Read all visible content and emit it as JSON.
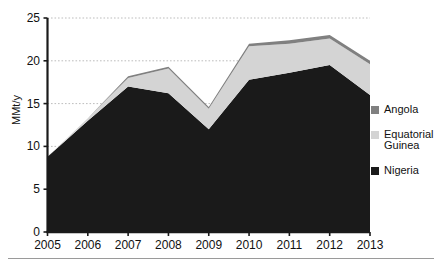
{
  "chart_data": {
    "type": "area",
    "stacked": true,
    "title": "",
    "subtitle": "",
    "xlabel": "",
    "ylabel": "MMt/y",
    "categories": [
      "2005",
      "2006",
      "2007",
      "2008",
      "2009",
      "2010",
      "2011",
      "2012",
      "2013"
    ],
    "x": [
      2005,
      2006,
      2007,
      2008,
      2009,
      2010,
      2011,
      2012,
      2013
    ],
    "series": [
      {
        "name": "Nigeria",
        "color": "#1a1a1a",
        "values": [
          8.8,
          13.0,
          17.0,
          16.2,
          12.0,
          17.8,
          18.6,
          19.5,
          16.0
        ]
      },
      {
        "name": "Equatorial Guinea",
        "color": "#d4d4d4",
        "values": [
          0.0,
          0.3,
          1.0,
          2.9,
          2.4,
          3.9,
          3.4,
          3.1,
          3.6
        ]
      },
      {
        "name": "Angola",
        "color": "#808080",
        "values": [
          0.0,
          0.0,
          0.2,
          0.2,
          0.2,
          0.3,
          0.4,
          0.4,
          0.4
        ]
      }
    ],
    "totals": [
      8.8,
      13.3,
      18.2,
      19.3,
      14.6,
      22.0,
      22.4,
      23.0,
      20.0
    ],
    "ylim": [
      0,
      25
    ],
    "yticks": [
      0,
      5,
      10,
      15,
      20,
      25
    ],
    "ytick_labels": [
      "0",
      "5",
      "10",
      "15",
      "20",
      "25"
    ],
    "xlim": [
      2005,
      2013
    ],
    "grid": {
      "horizontal": true,
      "vertical": false,
      "style": "dotted",
      "color": "#bdbdbd"
    },
    "legend": {
      "position": "right",
      "entries": [
        "Angola",
        "Equatorial Guinea",
        "Nigeria"
      ]
    }
  },
  "legend": {
    "items": [
      {
        "label": "Angola",
        "color": "#808080"
      },
      {
        "label": "Equatorial Guinea",
        "color": "#d4d4d4"
      },
      {
        "label": "Nigeria",
        "color": "#1a1a1a"
      }
    ]
  },
  "axes": {
    "y_label": "MMt/y",
    "y_ticks": [
      "25",
      "20",
      "15",
      "10",
      "5",
      "0"
    ],
    "x_ticks": [
      "2005",
      "2006",
      "2007",
      "2008",
      "2009",
      "2010",
      "2011",
      "2012",
      "2013"
    ]
  },
  "colors": {
    "background": "#ffffff",
    "axis": "#1a1a1a",
    "grid": "#bdbdbd",
    "rule": "#9a9a9a"
  }
}
